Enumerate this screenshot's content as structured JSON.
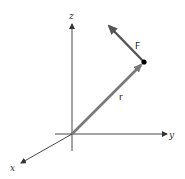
{
  "diagram": {
    "type": "3d-vector-diagram",
    "axes": {
      "x": {
        "label": "x"
      },
      "y": {
        "label": "y"
      },
      "z": {
        "label": "z"
      }
    },
    "vectors": [
      {
        "name": "r",
        "label": "r",
        "from": "origin",
        "to": "point",
        "color": "#7a7a7a"
      },
      {
        "name": "F",
        "label": "F",
        "from": "point",
        "color": "#555555"
      }
    ],
    "point": {
      "color": "#000000"
    },
    "colors": {
      "axis": "#333333",
      "vector_r": "#7a7a7a",
      "vector_F": "#555555",
      "background": "#ffffff"
    }
  }
}
